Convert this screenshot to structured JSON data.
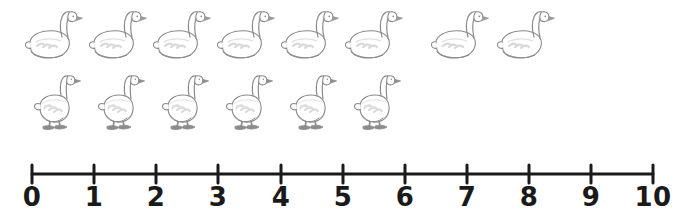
{
  "worksheet": {
    "background_color": "#ffffff",
    "object_name": "goose",
    "total_count": 14
  },
  "goose_rows": [
    {
      "row_name": "swimming-geese-row",
      "pose": "swimming",
      "count": 8,
      "outline_color": "#8a8a8a",
      "fill_color": "#ffffff",
      "wing_color": "#d9d9d9",
      "beak_color": "#9a9a9a",
      "start_x": 24,
      "spacing": 64,
      "top": 4,
      "items": [
        {
          "index": 1,
          "x": 24
        },
        {
          "index": 2,
          "x": 88
        },
        {
          "index": 3,
          "x": 152
        },
        {
          "index": 4,
          "x": 216
        },
        {
          "index": 5,
          "x": 280
        },
        {
          "index": 6,
          "x": 344
        },
        {
          "index": 7,
          "x": 430
        },
        {
          "index": 8,
          "x": 496
        }
      ]
    },
    {
      "row_name": "standing-geese-row",
      "pose": "standing",
      "count": 6,
      "outline_color": "#8a8a8a",
      "fill_color": "#ffffff",
      "wing_color": "#dcdcdc",
      "feet_color": "#8c8c8c",
      "start_x": 30,
      "spacing": 64,
      "top": 72,
      "items": [
        {
          "index": 1,
          "x": 30
        },
        {
          "index": 2,
          "x": 94
        },
        {
          "index": 3,
          "x": 158
        },
        {
          "index": 4,
          "x": 222
        },
        {
          "index": 5,
          "x": 286
        },
        {
          "index": 6,
          "x": 350
        }
      ]
    }
  ],
  "number_line": {
    "name": "number-line",
    "axis_color": "#1a1a1a",
    "axis_y": 24,
    "axis_stroke_width": 3,
    "tick_stroke_width": 3,
    "tick_half_height": 9,
    "start_x": 32,
    "end_x": 653,
    "min": 0,
    "max": 10,
    "step": 1,
    "ticks": [
      {
        "value": 0,
        "label": "0",
        "x": 32
      },
      {
        "value": 1,
        "label": "1",
        "x": 94
      },
      {
        "value": 2,
        "label": "2",
        "x": 156
      },
      {
        "value": 3,
        "label": "3",
        "x": 218
      },
      {
        "value": 4,
        "label": "4",
        "x": 281
      },
      {
        "value": 5,
        "label": "5",
        "x": 343
      },
      {
        "value": 6,
        "label": "6",
        "x": 405
      },
      {
        "value": 7,
        "label": "7",
        "x": 467
      },
      {
        "value": 8,
        "label": "8",
        "x": 529
      },
      {
        "value": 9,
        "label": "9",
        "x": 591
      },
      {
        "value": 10,
        "label": "10",
        "x": 653
      }
    ]
  }
}
